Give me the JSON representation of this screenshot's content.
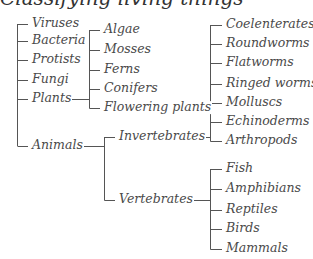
{
  "title": "Classifying living things",
  "diagram": {
    "root_children": [
      "Viruses",
      "Bacteria",
      "Protists",
      "Fungi",
      "Plants",
      "Animals"
    ],
    "plants": [
      "Algae",
      "Mosses",
      "Ferns",
      "Conifers",
      "Flowering plants"
    ],
    "animals": [
      "Invertebrates",
      "Vertebrates"
    ],
    "invertebrates": [
      "Coelenterates",
      "Roundworms",
      "Flatworms",
      "Ringed worms",
      "Molluscs",
      "Echinoderms",
      "Arthropods"
    ],
    "vertebrates": [
      "Fish",
      "Amphibians",
      "Reptiles",
      "Birds",
      "Mammals"
    ],
    "line_color": "#555555",
    "text_color": "#4a4a4a"
  }
}
